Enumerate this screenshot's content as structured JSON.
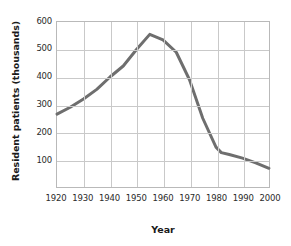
{
  "chart_data": {
    "type": "line",
    "title": "",
    "xlabel": "Year",
    "ylabel": "Resident patients (thousands)",
    "xlim": [
      1920,
      2000
    ],
    "ylim": [
      0,
      600
    ],
    "grid": true,
    "legend": null,
    "line_color": "#6e6e6e",
    "x_ticks": [
      1920,
      1930,
      1940,
      1950,
      1960,
      1970,
      1980,
      1990,
      2000
    ],
    "y_ticks": [
      100,
      200,
      300,
      400,
      500,
      600
    ],
    "series": [
      {
        "name": "Resident patients",
        "x": [
          1920,
          1925,
          1930,
          1935,
          1940,
          1945,
          1950,
          1955,
          1960,
          1965,
          1967,
          1970,
          1975,
          1980,
          1982,
          1985,
          1990,
          1995,
          2000
        ],
        "values": [
          265,
          290,
          320,
          355,
          400,
          440,
          500,
          555,
          535,
          490,
          450,
          390,
          250,
          145,
          125,
          118,
          105,
          88,
          68
        ]
      }
    ]
  },
  "axes": {
    "y_title": "Resident patients (thousands)",
    "x_title": "Year",
    "y_tick_labels": [
      "600",
      "500",
      "400",
      "300",
      "200",
      "100"
    ],
    "x_tick_labels": [
      "1920",
      "1930",
      "1940",
      "1950",
      "1960",
      "1970",
      "1980",
      "1990",
      "2000"
    ]
  }
}
